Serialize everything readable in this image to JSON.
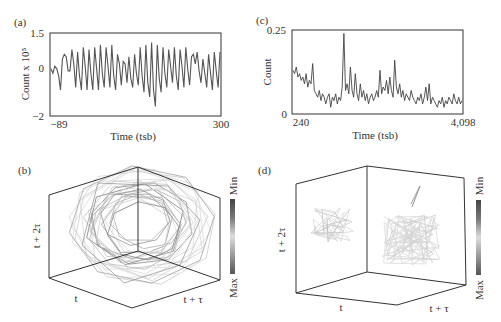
{
  "panels": {
    "a": {
      "label": "(a)",
      "ylabel": "Count x 10⁵",
      "xlabel": "Time (tsb)",
      "yticks": [
        "1.5",
        "0",
        "−2"
      ],
      "xticks": [
        "−89",
        "300"
      ]
    },
    "c": {
      "label": "(c)",
      "ylabel": "Count",
      "xlabel": "Time (tsb)",
      "yticks": [
        "0.25",
        "0"
      ],
      "xticks": [
        "240",
        "4,098"
      ]
    },
    "b": {
      "label": "(b)",
      "axis_x": "t",
      "axis_y": "t + τ",
      "axis_z": "t + 2τ",
      "colorbar_min": "Min",
      "colorbar_max": "Max"
    },
    "d": {
      "label": "(d)",
      "axis_x": "t",
      "axis_y": "t + τ",
      "axis_z": "t + 2τ",
      "colorbar_min": "Min",
      "colorbar_max": "Max"
    }
  },
  "colors": {
    "line": "#555555",
    "frame": "#333333",
    "trace_light": "#bbbbbb",
    "trace_dark": "#777777"
  },
  "chart_data": [
    {
      "id": "a",
      "type": "line",
      "title": "(a)",
      "xlabel": "Time (tsb)",
      "ylabel": "Count x 10^5",
      "xlim": [
        -89,
        300
      ],
      "ylim": [
        -2,
        1.5
      ],
      "x_ticks": [
        -89,
        300
      ],
      "y_ticks": [
        -2,
        0,
        1.5
      ],
      "grid": false,
      "description": "Quasi-periodic oscillation, ~40 cycles, amplitude roughly -1.2 to 1.1, largest trough near t=110 (about -1.7)",
      "values": [
        0.0,
        -0.2,
        0.1,
        0.0,
        -0.3,
        -0.9,
        0.4,
        0.6,
        0.5,
        -0.1,
        -0.1,
        0.8,
        0.2,
        -0.8,
        0.7,
        -0.3,
        -0.9,
        0.9,
        0.1,
        -0.9,
        0.8,
        -0.2,
        -0.9,
        0.9,
        0.0,
        -0.9,
        1.0,
        -0.2,
        -0.8,
        0.9,
        0.1,
        -0.8,
        1.0,
        -0.3,
        -0.9,
        0.6,
        0.2,
        -0.7,
        0.3,
        0.2,
        -0.6,
        0.5,
        -0.4,
        -0.8,
        0.6,
        -0.2,
        -0.7,
        0.9,
        -0.3,
        -1.0,
        1.0,
        -0.6,
        -1.2,
        1.1,
        -0.9,
        -1.6,
        1.0,
        -0.4,
        -1.0,
        0.9,
        -0.2,
        -0.8,
        0.8,
        0.1,
        -0.6,
        0.9,
        -0.3,
        -0.9,
        0.8,
        0.1,
        -0.8,
        0.9,
        0.0,
        -0.7,
        0.5,
        0.6,
        0.2,
        0.7,
        -0.1,
        -0.6,
        0.4,
        -0.2,
        -0.8,
        0.6,
        -0.2,
        -0.9,
        0.7,
        -0.1,
        -0.8,
        0.7
      ]
    },
    {
      "id": "c",
      "type": "line",
      "title": "(c)",
      "xlabel": "Time (tsb)",
      "ylabel": "Count",
      "xlim": [
        240,
        4098
      ],
      "ylim": [
        0,
        0.25
      ],
      "x_ticks": [
        240,
        4098
      ],
      "y_ticks": [
        0,
        0.25
      ],
      "grid": false,
      "description": "Noisy decaying series from ~0.13 to ~0.03 with spikes (max ~0.24 near t=1300)",
      "values": [
        0.13,
        0.12,
        0.14,
        0.11,
        0.12,
        0.1,
        0.11,
        0.09,
        0.12,
        0.08,
        0.1,
        0.09,
        0.15,
        0.07,
        0.06,
        0.05,
        0.07,
        0.04,
        0.06,
        0.05,
        0.03,
        0.05,
        0.06,
        0.02,
        0.05,
        0.04,
        0.06,
        0.03,
        0.05,
        0.04,
        0.08,
        0.24,
        0.07,
        0.09,
        0.06,
        0.14,
        0.07,
        0.05,
        0.12,
        0.06,
        0.04,
        0.09,
        0.05,
        0.07,
        0.04,
        0.06,
        0.03,
        0.05,
        0.06,
        0.04,
        0.05,
        0.07,
        0.05,
        0.13,
        0.06,
        0.08,
        0.07,
        0.1,
        0.06,
        0.11,
        0.07,
        0.05,
        0.16,
        0.08,
        0.06,
        0.09,
        0.05,
        0.07,
        0.04,
        0.06,
        0.05,
        0.04,
        0.07,
        0.05,
        0.04,
        0.03,
        0.05,
        0.04,
        0.06,
        0.03,
        0.05,
        0.08,
        0.04,
        0.09,
        0.03,
        0.05,
        0.04,
        0.03,
        0.02,
        0.04,
        0.03,
        0.05,
        0.02,
        0.04,
        0.03,
        0.05,
        0.04,
        0.03,
        0.06,
        0.04,
        0.03,
        0.05,
        0.03,
        0.04
      ]
    },
    {
      "id": "b",
      "type": "scatter3d",
      "title": "(b)",
      "axes": [
        "t",
        "t + τ",
        "t + 2τ"
      ],
      "colorbar": {
        "top": "Min",
        "bottom": "Max"
      },
      "description": "Delay-embedding phase portrait of (a): dense loops forming a ring/torus-like attractor"
    },
    {
      "id": "d",
      "type": "scatter3d",
      "title": "(d)",
      "axes": [
        "t",
        "t + τ",
        "t + 2τ"
      ],
      "colorbar": {
        "top": "Min",
        "bottom": "Max"
      },
      "description": "Delay-embedding phase portrait of (c): irregular jagged trajectory in two clusters"
    }
  ]
}
